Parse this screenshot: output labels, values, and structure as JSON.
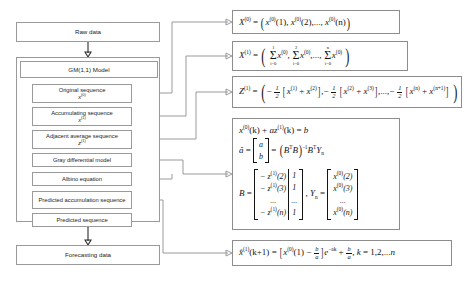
{
  "diagram": {
    "pipeline": {
      "raw_data": "Raw data",
      "model_title": "GM(1,1) Model",
      "forecasting_data": "Forecasting data",
      "steps": [
        {
          "label": "Original sequence",
          "symbol": "x",
          "superscript": "(0)"
        },
        {
          "label": "Accumulating sequence",
          "symbol": "x",
          "superscript": "(1)"
        },
        {
          "label": "Adjacent average sequence",
          "symbol": "z",
          "superscript": "(1)"
        },
        {
          "label": "Gray differential model",
          "symbol": "",
          "superscript": ""
        },
        {
          "label": "Albino equation",
          "symbol": "",
          "superscript": ""
        },
        {
          "label": "Predicted accumulation sequence",
          "symbol": "",
          "superscript": ""
        },
        {
          "label": "Predicted sequence",
          "symbol": "",
          "superscript": ""
        }
      ]
    },
    "formulas": {
      "f1": {
        "lhs": "X",
        "lhs_sup": "(0)",
        "text": "X^(0) = ( x^(0)(1), x^(0)(2),..., x^(0)(n) )",
        "terms": [
          "x^(0)(1)",
          "x^(0)(2)",
          "...,",
          "x^(0)(n)"
        ]
      },
      "f2": {
        "lhs": "X",
        "lhs_sup": "(1)",
        "text": "X^(1) = ( sum_{i=0}^{1} x^(0), sum_{i=0}^{2} x^(0),..., sum_{i=0}^{n} x^(0) )",
        "sums": [
          {
            "upper": "1",
            "lower": "i=0",
            "body": "x",
            "body_sup": "(0)"
          },
          {
            "upper": "2",
            "lower": "i=0",
            "body": "x",
            "body_sup": "(0)"
          },
          {
            "upper": "n",
            "lower": "i=0",
            "body": "x",
            "body_sup": "(0)"
          }
        ]
      },
      "f3": {
        "lhs": "Z",
        "lhs_sup": "(1)",
        "text": "Z^(1) = ( -1/2[x^(1)+x^(2)], -1/2[x^(2)+x^(3)],..., -1/2[x^(n)+x^(n+1)] )",
        "terms": [
          {
            "a": "x",
            "a_sup": "(1)",
            "b": "x",
            "b_sup": "(2)"
          },
          {
            "a": "x",
            "a_sup": "(2)",
            "b": "x",
            "b_sup": "(3)"
          },
          {
            "a": "x",
            "a_sup": "(n)",
            "b": "x",
            "b_sup": "(n+1)"
          }
        ],
        "coefficient": "1/2"
      },
      "f4": {
        "line1": "x^(0)(k) + az^(1)(k) = b",
        "line2": "a_hat = [a; b] = (B^T B)^-1 B^T Y_n",
        "line3": "B = [ -z^(1)(2) 1 ; -z^(1)(3) 1 ; ... ... ; -z^(1)(n) 1 ] , Y_n = [ x^(0)(2) ; x^(0)(3) ; ... ; x^(0)(n) ]",
        "B_col1": [
          "− z^(1)(2)",
          "− z^(1)(3)",
          "...",
          "− z^(1)(n)"
        ],
        "B_col2": [
          "1",
          "1",
          "...",
          "1"
        ],
        "Y_col": [
          "x^(0)(2)",
          "x^(0)(3)",
          "...",
          "x^(0)(n)"
        ],
        "a_hat_col": [
          "a",
          "b"
        ]
      },
      "f5": {
        "text": "x_hat^(1)(k+1) = [ x^(0)(1) − b/a ] e^(−ak) + b/a , k = 1,2,...n",
        "range": "k = 1,2,...n"
      }
    }
  }
}
